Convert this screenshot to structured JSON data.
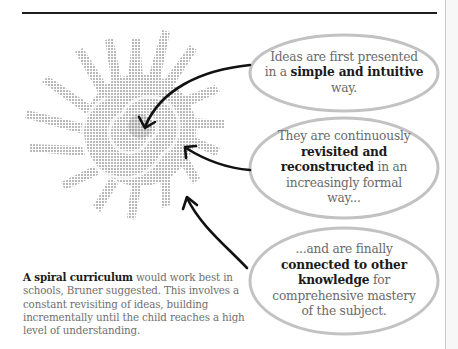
{
  "illustration": {
    "icon": "spiral-sun-icon",
    "halftone_color": "#b8b8b8",
    "arrow_color": "#111111",
    "bubble_outline_color": "#bdbdbd"
  },
  "bubbles": [
    {
      "pre": "Ideas are first presented in a ",
      "bold": "simple and intuitive",
      "post": " way."
    },
    {
      "pre": "They are continuously ",
      "bold": "revisited and reconstructed",
      "post": " in an increasingly formal way..."
    },
    {
      "pre": "...and are finally ",
      "bold": "connected to other knowledge",
      "post": " for comprehensive mastery of the subject."
    }
  ],
  "caption": {
    "bold": "A spiral curriculum",
    "text": " would work best in schools, Bruner suggested. This involves a constant revisiting of ideas, building incrementally until the child reaches a high level of understanding."
  }
}
